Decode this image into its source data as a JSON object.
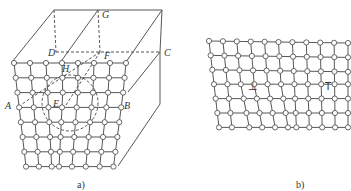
{
  "figure_a": {
    "caption": "a)",
    "point_labels": {
      "A": "A",
      "B": "B",
      "C": "C",
      "D": "D",
      "E": "E",
      "F": "F",
      "G": "G",
      "H": "H"
    },
    "lattice_rows": 8,
    "lattice_cols": 8,
    "description": "3D crystal block with screw/edge dislocation line; dashed circle around E"
  },
  "figure_b": {
    "caption": "b)",
    "symbols": [
      "⊥",
      "T"
    ],
    "lattice_rows": 7,
    "lattice_cols": 11,
    "description": "2D lattice with positive and negative edge dislocations"
  },
  "colors": {
    "line": "#444444",
    "node_fill": "#ffffff"
  }
}
